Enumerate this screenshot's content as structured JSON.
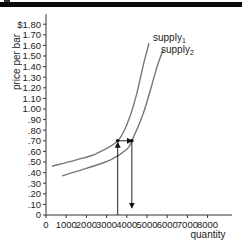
{
  "chart_data": {
    "type": "line",
    "title": "",
    "xlabel": "quantity",
    "ylabel": "price per bar",
    "xlim": [
      0,
      9000
    ],
    "ylim": [
      0,
      1.8
    ],
    "x_ticks": [
      "0",
      "1000",
      "2000",
      "3000",
      "4000",
      "5000",
      "6000",
      "7000",
      "8000"
    ],
    "y_ticks": [
      "0",
      ".10",
      ".20",
      ".30",
      ".40",
      ".50",
      ".60",
      ".70",
      ".80",
      ".90",
      "1.00",
      "1.10",
      "1.20",
      "1.30",
      "1.40",
      "1.50",
      "1.60",
      "1.70",
      "$1.80"
    ],
    "grid": false,
    "series": [
      {
        "name": "supply1",
        "label_base": "supply",
        "label_sub": "1",
        "points": [
          [
            300,
            0.46
          ],
          [
            1500,
            0.52
          ],
          [
            2500,
            0.58
          ],
          [
            3550,
            0.7
          ],
          [
            4100,
            0.9
          ],
          [
            4500,
            1.15
          ],
          [
            4800,
            1.4
          ],
          [
            5100,
            1.62
          ]
        ]
      },
      {
        "name": "supply2",
        "label_base": "supply",
        "label_sub": "2",
        "points": [
          [
            800,
            0.37
          ],
          [
            2000,
            0.44
          ],
          [
            3200,
            0.52
          ],
          [
            4000,
            0.62
          ],
          [
            4250,
            0.7
          ],
          [
            4800,
            0.95
          ],
          [
            5200,
            1.2
          ],
          [
            5500,
            1.4
          ],
          [
            5800,
            1.56
          ]
        ]
      }
    ],
    "annotations": [
      {
        "type": "arrow",
        "direction": "up",
        "from": [
          3550,
          0.0
        ],
        "to": [
          3550,
          0.7
        ]
      },
      {
        "type": "arrow",
        "direction": "right",
        "from": [
          3550,
          0.7
        ],
        "to": [
          4250,
          0.7
        ]
      },
      {
        "type": "arrow",
        "direction": "down",
        "from": [
          4250,
          0.7
        ],
        "to": [
          4250,
          0.05
        ]
      },
      {
        "type": "point",
        "at": [
          3550,
          0.7
        ]
      },
      {
        "type": "point",
        "at": [
          4250,
          0.7
        ]
      }
    ]
  },
  "labels": {
    "ylabel": "price per bar",
    "xlabel": "quantity",
    "supply1_base": "supply",
    "supply1_sub": "1",
    "supply2_base": "supply",
    "supply2_sub": "2"
  }
}
